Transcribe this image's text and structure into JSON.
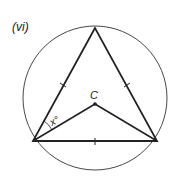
{
  "figure": {
    "label": "(vi)",
    "center_label": "C",
    "angle_label": "x°",
    "colors": {
      "stroke": "#222222",
      "background": "#ffffff"
    }
  }
}
